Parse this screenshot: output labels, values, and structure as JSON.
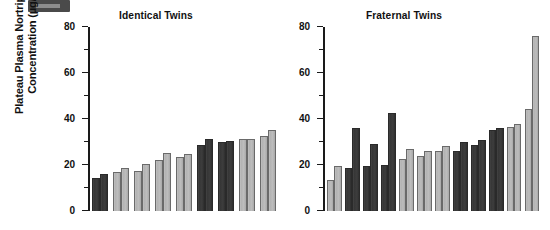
{
  "figure": {
    "ylabel_line1": "Plateau Plasma Nortriptyline",
    "ylabel_line2": "Concentration (µg/L)",
    "artifact_name": "scan-label-artifact",
    "colors": {
      "dark_bar": "#383838",
      "light_bar": "#b8b8b8",
      "bar_outline": "#5f5f5f",
      "axis": "#1a1a1a",
      "text": "#111111",
      "background": "#ffffff"
    }
  },
  "chart_data": [
    {
      "type": "bar",
      "title": "Identical Twins",
      "xlabel": "",
      "ylabel": "Plateau Plasma Nortriptyline Concentration (µg/L)",
      "ylim": [
        0,
        80
      ],
      "yticks": [
        0,
        20,
        40,
        60,
        80
      ],
      "yminor_ticks": [
        10,
        30,
        50,
        70
      ],
      "grid": false,
      "legend": "none",
      "categories": [
        "1",
        "2",
        "3",
        "4",
        "5",
        "6",
        "7",
        "8",
        "9"
      ],
      "series": [
        {
          "name": "Twin A",
          "values": [
            14.5,
            17.0,
            17.3,
            22.2,
            23.6,
            28.5,
            30.2,
            31.3,
            32.8
          ]
        },
        {
          "name": "Twin B",
          "values": [
            16.0,
            18.9,
            20.6,
            25.4,
            24.8,
            31.2,
            30.3,
            31.4,
            35.4
          ]
        }
      ],
      "pair_shades": [
        "dark",
        "light",
        "light",
        "light",
        "light",
        "dark",
        "dark",
        "light",
        "light"
      ]
    },
    {
      "type": "bar",
      "title": "Fraternal Twins",
      "xlabel": "",
      "ylabel": "Plateau Plasma Nortriptyline Concentration (µg/L)",
      "ylim": [
        0,
        80
      ],
      "yticks": [
        0,
        20,
        40,
        60,
        80
      ],
      "yminor_ticks": [
        10,
        30,
        50,
        70
      ],
      "grid": false,
      "legend": "none",
      "categories": [
        "1",
        "2",
        "3",
        "4",
        "5",
        "6",
        "7",
        "8",
        "9",
        "10",
        "11",
        "12"
      ],
      "series": [
        {
          "name": "Twin A",
          "values": [
            13.6,
            18.6,
            19.7,
            19.8,
            22.6,
            24.1,
            26.0,
            26.0,
            28.7,
            35.4,
            36.6,
            44.2
          ]
        },
        {
          "name": "Twin B",
          "values": [
            19.5,
            36.2,
            29.2,
            42.4,
            26.9,
            26.3,
            28.2,
            30.2,
            30.7,
            36.0,
            37.8,
            76.0
          ]
        }
      ],
      "pair_shades": [
        "light",
        "dark",
        "dark",
        "dark",
        "light",
        "light",
        "light",
        "dark",
        "dark",
        "dark",
        "light",
        "light"
      ]
    }
  ]
}
